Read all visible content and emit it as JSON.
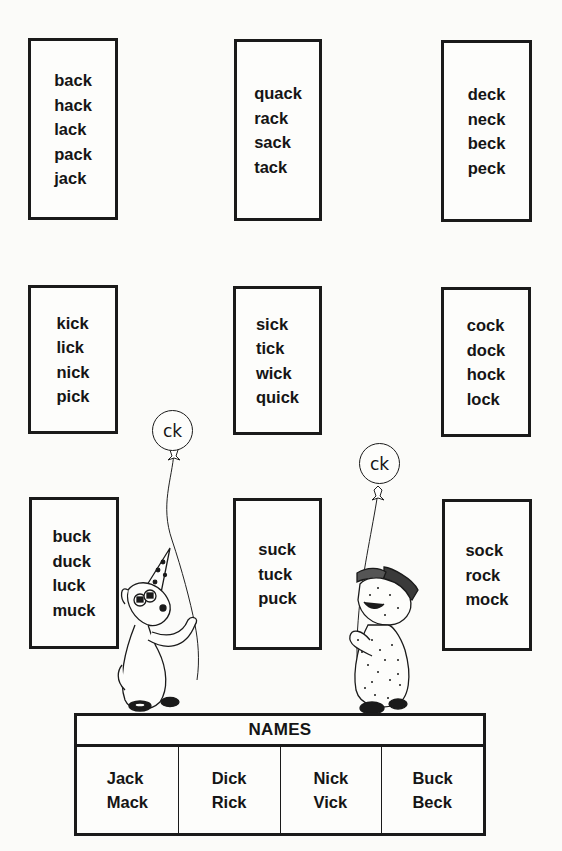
{
  "word_boxes": [
    {
      "row": 1,
      "col": 1,
      "words": [
        "back",
        "hack",
        "lack",
        "pack",
        "jack"
      ]
    },
    {
      "row": 1,
      "col": 2,
      "words": [
        "quack",
        "rack",
        "sack",
        "tack"
      ]
    },
    {
      "row": 1,
      "col": 3,
      "words": [
        "deck",
        "neck",
        "beck",
        "peck"
      ]
    },
    {
      "row": 2,
      "col": 1,
      "words": [
        "kick",
        "lick",
        "nick",
        "pick"
      ]
    },
    {
      "row": 2,
      "col": 2,
      "words": [
        "sick",
        "tick",
        "wick",
        "quick"
      ]
    },
    {
      "row": 2,
      "col": 3,
      "words": [
        "cock",
        "dock",
        "hock",
        "lock"
      ]
    },
    {
      "row": 3,
      "col": 1,
      "words": [
        "buck",
        "duck",
        "luck",
        "muck"
      ]
    },
    {
      "row": 3,
      "col": 2,
      "words": [
        "suck",
        "tuck",
        "puck"
      ]
    },
    {
      "row": 3,
      "col": 3,
      "words": [
        "sock",
        "rock",
        "mock"
      ]
    }
  ],
  "balloons": [
    {
      "label": "ck",
      "holder": "dog-with-party-hat"
    },
    {
      "label": "ck",
      "holder": "curly-sheep-with-cap"
    }
  ],
  "names_table": {
    "title": "NAMES",
    "columns": [
      [
        "Jack",
        "Mack"
      ],
      [
        "Dick",
        "Rick"
      ],
      [
        "Nick",
        "Vick"
      ],
      [
        "Buck",
        "Beck"
      ]
    ]
  }
}
